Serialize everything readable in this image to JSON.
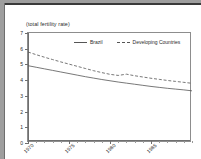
{
  "window": {
    "background_color": "#9e9e9e",
    "page_color": "#ffffff",
    "border_color": "#3a3a3a"
  },
  "chart_data": {
    "type": "line",
    "title": "(total fertility rate)",
    "xlabel": "",
    "ylabel": "",
    "xlim": [
      1970,
      1990
    ],
    "ylim": [
      0,
      7
    ],
    "grid": false,
    "legend_position": "top-center-inside",
    "ytick_labels": [
      "0",
      "1",
      "2",
      "3",
      "4",
      "5",
      "6",
      "7"
    ],
    "ytick_values": [
      0,
      1,
      2,
      3,
      4,
      5,
      6,
      7
    ],
    "xtick_labels": [
      "1970",
      "1975",
      "1980",
      "1985"
    ],
    "xtick_values": [
      1970,
      1975,
      1980,
      1985
    ],
    "x": [
      1970,
      1971,
      1972,
      1973,
      1974,
      1975,
      1976,
      1977,
      1978,
      1979,
      1980,
      1981,
      1982,
      1983,
      1984,
      1985,
      1986,
      1987,
      1988,
      1989,
      1990
    ],
    "series": [
      {
        "name": "Brazil",
        "style": "solid",
        "color": "#555555",
        "values": [
          4.92,
          4.82,
          4.72,
          4.62,
          4.52,
          4.42,
          4.32,
          4.22,
          4.13,
          4.04,
          3.96,
          3.88,
          3.81,
          3.74,
          3.67,
          3.6,
          3.54,
          3.48,
          3.43,
          3.38,
          3.32
        ]
      },
      {
        "name": "Developing Countries",
        "style": "dashed",
        "color": "#555555",
        "values": [
          5.79,
          5.62,
          5.46,
          5.31,
          5.16,
          5.02,
          4.88,
          4.74,
          4.6,
          4.48,
          4.37,
          4.3,
          4.38,
          4.28,
          4.2,
          4.12,
          4.05,
          3.98,
          3.92,
          3.86,
          3.8
        ]
      }
    ]
  },
  "legend": {
    "entries": [
      {
        "label": "Brazil"
      },
      {
        "label": "Developing Countries"
      }
    ]
  }
}
